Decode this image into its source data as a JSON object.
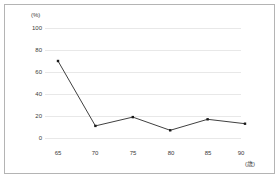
{
  "chart_data": {
    "type": "line",
    "title": "",
    "xlabel": "(歳)",
    "ylabel": "(%)",
    "x": [
      65,
      70,
      75,
      80,
      85,
      90
    ],
    "categories": [
      "65",
      "70",
      "75",
      "80",
      "85",
      "90"
    ],
    "values": [
      70,
      11,
      19,
      7,
      17,
      13
    ],
    "series": [
      {
        "name": "",
        "values": [
          70,
          11,
          19,
          7,
          17,
          13
        ]
      }
    ],
    "ylim": [
      0,
      100
    ],
    "y_ticks": [
      0,
      20,
      40,
      60,
      80,
      100
    ],
    "y_tick_labels": [
      "0",
      "20",
      "40",
      "60",
      "80",
      "100"
    ],
    "x_tick_labels": [
      "65",
      "70",
      "75",
      "80",
      "85",
      "90"
    ],
    "grid": true,
    "grid_axis": "y",
    "legend": false,
    "legend_position": "none",
    "marker": "square",
    "line_color": "#404040",
    "marker_color": "#1a1a1a",
    "grid_color": "#e8e8e8",
    "text_color": "#3a3a3a",
    "background_color": "#ffffff",
    "border_color": "#b4b4b4"
  },
  "axes": {
    "y_unit": "(%)",
    "x_unit": "(歳)"
  }
}
